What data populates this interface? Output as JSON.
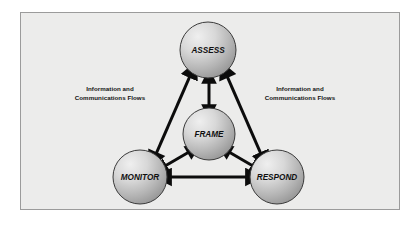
{
  "diagram": {
    "background_color": "#ececeb",
    "border_color": "#9b9b9b",
    "nodes": [
      {
        "id": "assess",
        "label": "ASSESS",
        "cx": 208,
        "cy": 50,
        "r": 28
      },
      {
        "id": "frame",
        "label": "FRAME",
        "cx": 209,
        "cy": 134,
        "r": 26
      },
      {
        "id": "monitor",
        "label": "MONITOR",
        "cx": 140,
        "cy": 177,
        "r": 27
      },
      {
        "id": "respond",
        "label": "RESPOND",
        "cx": 277,
        "cy": 177,
        "r": 27
      }
    ],
    "node_style": {
      "fill_light": "#ebebeb",
      "fill_dark": "#9d9d9d",
      "stroke": "#3a3a3a",
      "label_color": "#101010",
      "label_size": 8.2
    },
    "connectors": [
      {
        "id": "monitor-assess",
        "from": "monitor",
        "to": "assess",
        "kind": "double-arrow",
        "length": "long"
      },
      {
        "id": "assess-respond",
        "from": "assess",
        "to": "respond",
        "kind": "double-arrow",
        "length": "long"
      },
      {
        "id": "monitor-respond",
        "from": "monitor",
        "to": "respond",
        "kind": "double-arrow",
        "length": "long"
      },
      {
        "id": "frame-assess",
        "from": "frame",
        "to": "assess",
        "kind": "double-arrow",
        "length": "short"
      },
      {
        "id": "frame-monitor",
        "from": "frame",
        "to": "monitor",
        "kind": "double-arrow",
        "length": "short"
      },
      {
        "id": "frame-respond",
        "from": "frame",
        "to": "respond",
        "kind": "double-arrow",
        "length": "short"
      }
    ],
    "arrow_color": "#0c0c0c",
    "labels": {
      "left_flow_line1": "Information and",
      "left_flow_line2": "Communications Flows",
      "right_flow_line1": "Information and",
      "right_flow_line2": "Communications Flows"
    }
  }
}
